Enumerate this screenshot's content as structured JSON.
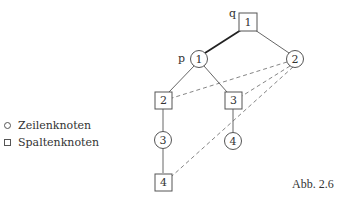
{
  "diagram": {
    "nodes": {
      "sq1": {
        "label": "1",
        "shape": "square",
        "x": 248,
        "y": 22
      },
      "c1": {
        "label": "1",
        "shape": "circle",
        "x": 199,
        "y": 59
      },
      "c2": {
        "label": "2",
        "shape": "circle",
        "x": 295,
        "y": 59
      },
      "sq2": {
        "label": "2",
        "shape": "square",
        "x": 163,
        "y": 100
      },
      "sq3": {
        "label": "3",
        "shape": "square",
        "x": 233,
        "y": 100
      },
      "c3": {
        "label": "3",
        "shape": "circle",
        "x": 163,
        "y": 140
      },
      "c4": {
        "label": "4",
        "shape": "circle",
        "x": 233,
        "y": 141
      },
      "sq4": {
        "label": "4",
        "shape": "square",
        "x": 163,
        "y": 182
      }
    },
    "node_labels": {
      "q": "q",
      "p": "p"
    },
    "solid_edges": [
      [
        "sq1",
        "c1",
        "bold"
      ],
      [
        "sq1",
        "c2"
      ],
      [
        "c1",
        "sq2"
      ],
      [
        "c1",
        "sq3"
      ],
      [
        "sq2",
        "c3"
      ],
      [
        "c3",
        "sq4"
      ],
      [
        "sq3",
        "c4"
      ]
    ],
    "dashed_edges": [
      [
        "c2",
        "sq2"
      ],
      [
        "c2",
        "sq3"
      ],
      [
        "c2",
        "sq4"
      ]
    ]
  },
  "legend": {
    "row_nodes": "Zeilenknoten",
    "column_nodes": "Spaltenknoten"
  },
  "caption": "Abb. 2.6"
}
